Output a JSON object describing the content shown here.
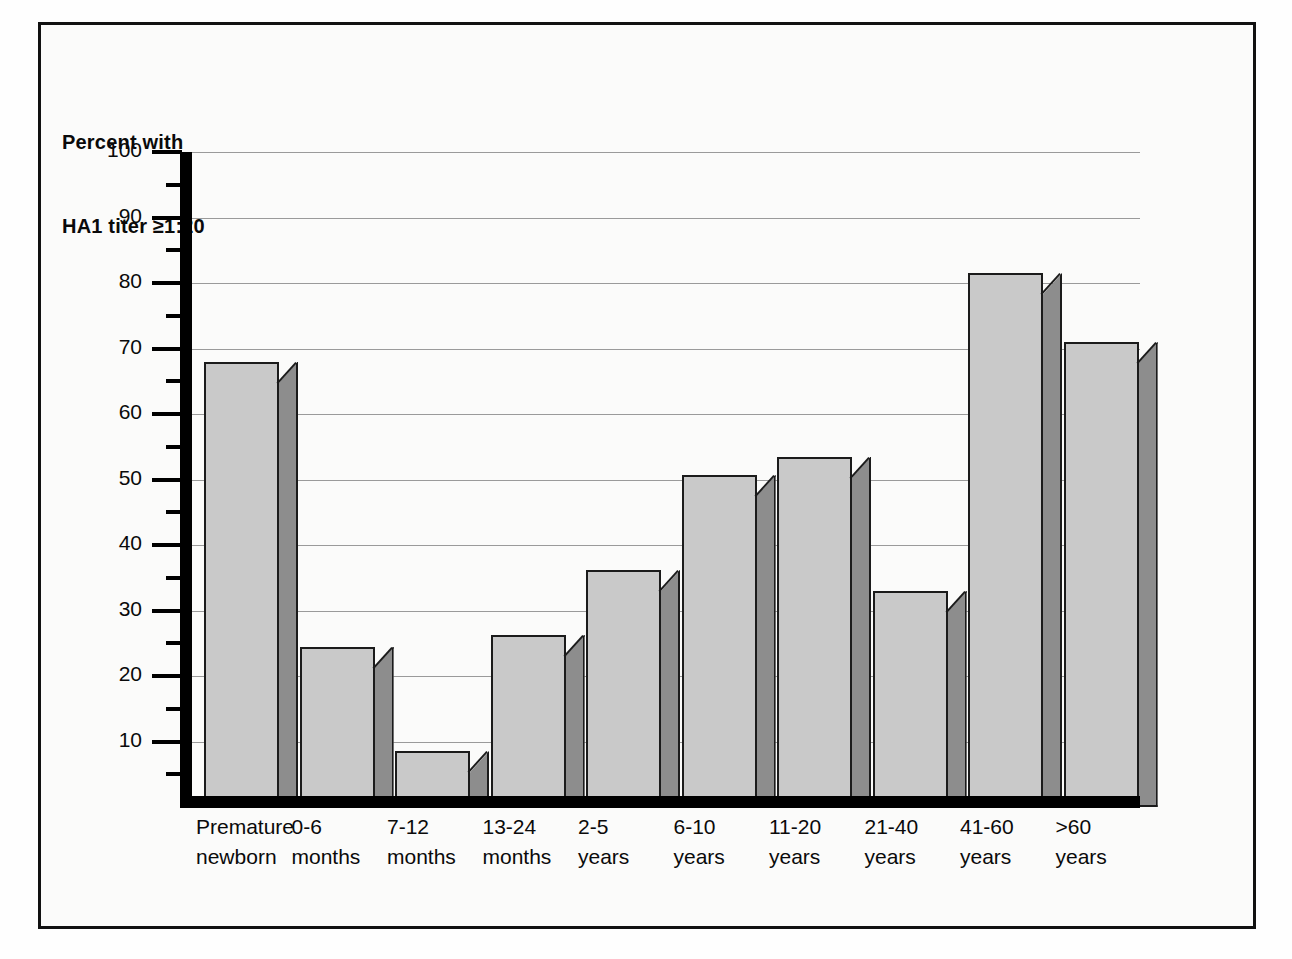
{
  "figure": {
    "frame_color": "#111111",
    "background": "#fbfbfa"
  },
  "axis_title": {
    "line1": "Percent with",
    "line2": "HA1 titer ≥1:20"
  },
  "chart_data": {
    "type": "bar",
    "title": "Percent with HA1 titer ≥1:20",
    "xlabel": "",
    "ylabel": "Percent with HA1 titer ≥1:20",
    "ylim": [
      0,
      100
    ],
    "grid": true,
    "legend": "none",
    "style": "3d-shaded-bars",
    "bar_face_color": "#c9c9c9",
    "bar_side_color": "#8d8d8d",
    "bar_edge_color": "#1b1b1b",
    "y_major_ticks": [
      10,
      20,
      30,
      40,
      50,
      60,
      70,
      80,
      90,
      100
    ],
    "y_minor_ticks": [
      5,
      15,
      25,
      35,
      45,
      55,
      65,
      75,
      85,
      95
    ],
    "y_tick_labels": [
      "10",
      "20",
      "30",
      "40",
      "50",
      "60",
      "70",
      "80",
      "90",
      "100"
    ],
    "categories": [
      "Premature newborn",
      "0-6 months",
      "7-12 months",
      "13-24 months",
      "2-5 years",
      "6-10 years",
      "11-20 years",
      "21-40 years",
      "41-60 years",
      ">60 years"
    ],
    "category_lines": [
      [
        "Premature",
        "newborn"
      ],
      [
        "0-6",
        "months"
      ],
      [
        "7-12",
        "months"
      ],
      [
        "13-24",
        "months"
      ],
      [
        "2-5",
        "years"
      ],
      [
        "6-10",
        "years"
      ],
      [
        "11-20",
        "years"
      ],
      [
        "21-40",
        "years"
      ],
      [
        "41-60",
        "years"
      ],
      [
        ">60",
        "years"
      ]
    ],
    "values": [
      68,
      24.5,
      8.5,
      26.3,
      36.2,
      50.7,
      53.5,
      33,
      81.5,
      71
    ]
  }
}
